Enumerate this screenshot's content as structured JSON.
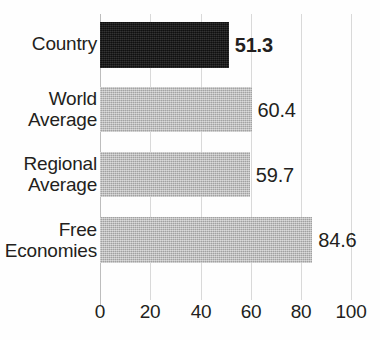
{
  "chart_data": {
    "type": "bar",
    "orientation": "horizontal",
    "title": "",
    "subtitle": "",
    "xlabel": "",
    "ylabel": "",
    "xlim": [
      0,
      100
    ],
    "xticks": [
      "0",
      "20",
      "40",
      "60",
      "80",
      "100"
    ],
    "grid": true,
    "legend": "none",
    "categories": [
      "Country",
      "World\nAverage",
      "Regional\nAverage",
      "Free\nEconomies"
    ],
    "values": [
      51.3,
      60.4,
      59.7,
      84.6
    ],
    "value_labels": [
      "51.3",
      "60.4",
      "59.7",
      "84.6"
    ],
    "bars": [
      {
        "category": "Country",
        "category_line1": "Country",
        "category_line2": "",
        "value": 51.3,
        "value_label": "51.3",
        "color": "#1a1a1a",
        "emphasis": true
      },
      {
        "category": "World Average",
        "category_line1": "World",
        "category_line2": "Average",
        "value": 60.4,
        "value_label": "60.4",
        "color": "#b5b5b5",
        "emphasis": false
      },
      {
        "category": "Regional Average",
        "category_line1": "Regional",
        "category_line2": "Average",
        "value": 59.7,
        "value_label": "59.7",
        "color": "#b5b5b5",
        "emphasis": false
      },
      {
        "category": "Free Economies",
        "category_line1": "Free",
        "category_line2": "Economies",
        "value": 84.6,
        "value_label": "84.6",
        "color": "#b5b5b5",
        "emphasis": false
      }
    ],
    "colors": {
      "highlight_bar": "#1a1a1a",
      "default_bar": "#b5b5b5",
      "gridline": "#d9d9d9",
      "axis": "#bdbdbd",
      "text": "#231f20",
      "background": "#fefefe"
    }
  }
}
